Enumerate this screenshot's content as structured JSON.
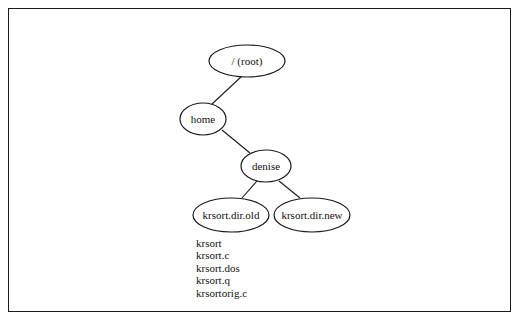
{
  "diagram": {
    "type": "directory-tree",
    "nodes": [
      {
        "id": "root",
        "label": "/ (root)",
        "cx": 247,
        "cy": 61,
        "rx": 38,
        "ry": 16
      },
      {
        "id": "home",
        "label": "home",
        "cx": 203,
        "cy": 119,
        "rx": 23,
        "ry": 16
      },
      {
        "id": "denise",
        "label": "denise",
        "cx": 266,
        "cy": 166,
        "rx": 25,
        "ry": 16
      },
      {
        "id": "old",
        "label": "krsort.dir.old",
        "cx": 231,
        "cy": 215,
        "rx": 38,
        "ry": 17
      },
      {
        "id": "new",
        "label": "krsort.dir.new",
        "cx": 312,
        "cy": 215,
        "rx": 38,
        "ry": 17
      }
    ],
    "edges": [
      {
        "from": "root",
        "to": "home"
      },
      {
        "from": "home",
        "to": "denise"
      },
      {
        "from": "denise",
        "to": "old"
      },
      {
        "from": "denise",
        "to": "new"
      }
    ],
    "files": [
      "krsort",
      "krsort.c",
      "krsort.dos",
      "krsort.q",
      "krsortorig.c"
    ]
  }
}
